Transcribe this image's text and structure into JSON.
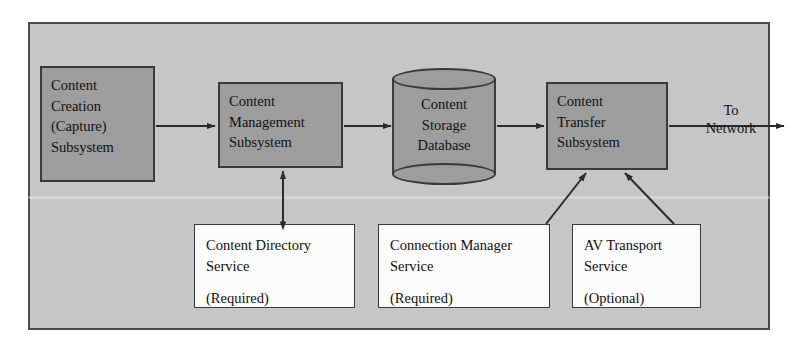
{
  "figure": {
    "frame_label": ""
  },
  "colors": {
    "page_background": "#ffffff",
    "frame_fill": "#c6c6c6",
    "frame_border": "#4a4a4a",
    "block_fill": "#9d9d9d",
    "block_border": "#3a3a3a",
    "service_fill": "#fbfbfb",
    "service_border": "#3a3a3a",
    "connector": "#2b2b2b",
    "text": "#111111"
  },
  "blocks": [
    {
      "id": "content-creation",
      "lines": [
        "Content",
        "Creation",
        "(Capture)",
        "Subsystem"
      ]
    },
    {
      "id": "content-management",
      "lines": [
        "Content",
        "Management",
        "Subsystem"
      ]
    },
    {
      "id": "content-transfer",
      "lines": [
        "Content",
        "Transfer",
        "Subsystem"
      ]
    }
  ],
  "database": {
    "id": "content-storage-database",
    "lines": [
      "Content",
      "Storage",
      "Database"
    ]
  },
  "services": [
    {
      "id": "content-directory-service",
      "lines": [
        "Content Directory",
        "Service"
      ],
      "requirement": "(Required)"
    },
    {
      "id": "connection-manager-service",
      "lines": [
        "Connection Manager",
        "Service"
      ],
      "requirement": "(Required)"
    },
    {
      "id": "av-transport-service",
      "lines": [
        "AV Transport",
        "Service"
      ],
      "requirement": "(Optional)"
    }
  ],
  "annotations": {
    "to_network": [
      "To",
      "Network"
    ]
  },
  "connections": [
    {
      "from": "content-creation",
      "to": "content-management",
      "style": "single-arrow",
      "direction": "right"
    },
    {
      "from": "content-management",
      "to": "content-storage-database",
      "style": "single-arrow",
      "direction": "right"
    },
    {
      "from": "content-storage-database",
      "to": "content-transfer",
      "style": "single-arrow",
      "direction": "right"
    },
    {
      "from": "content-transfer",
      "to": "to_network",
      "style": "single-arrow",
      "direction": "right"
    },
    {
      "from": "content-directory-service",
      "to": "content-management",
      "style": "double-arrow",
      "direction": "vertical"
    },
    {
      "from": "connection-manager-service",
      "to": "content-transfer",
      "style": "single-arrow",
      "direction": "diagonal-up-right"
    },
    {
      "from": "av-transport-service",
      "to": "content-transfer",
      "style": "single-arrow",
      "direction": "diagonal-up-left"
    }
  ]
}
